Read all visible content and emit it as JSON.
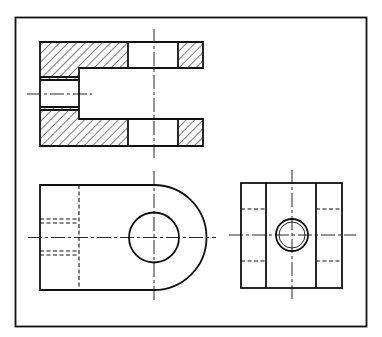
{
  "drawing": {
    "title": "",
    "colors": {
      "line": "#111111",
      "background": "#ffffff"
    },
    "views": [
      {
        "name": "sectional-top-view",
        "description": "Fork / clevis sectioned, hatched material with cross-hole and slot"
      },
      {
        "name": "front-view",
        "description": "Clevis elevation with rounded end, through-hole, hidden bore lines"
      },
      {
        "name": "side-view",
        "description": "End view with central tapped hole and hidden lines"
      }
    ]
  }
}
